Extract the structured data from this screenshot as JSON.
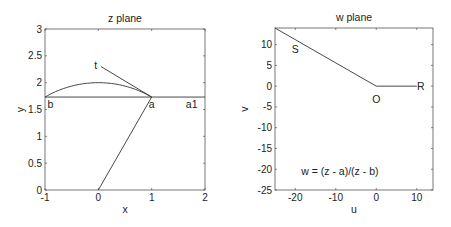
{
  "chart_data": [
    {
      "type": "line",
      "title": "z plane",
      "xlabel": "x",
      "ylabel": "y",
      "xlim": [
        -1,
        2
      ],
      "ylim": [
        0,
        3
      ],
      "xticks": [
        -1,
        0,
        1,
        2
      ],
      "xtick_labels": [
        "-1",
        "0",
        "1",
        "2"
      ],
      "yticks": [
        0,
        0.5,
        1,
        1.5,
        2,
        2.5,
        3
      ],
      "ytick_labels": [
        "0",
        "0.5",
        "1",
        "1.5",
        "2",
        "2.5",
        "3"
      ],
      "grid": false,
      "series": [
        {
          "name": "horizontal line y=sqrt(3)",
          "x": [
            -1,
            2
          ],
          "y": [
            1.732,
            1.732
          ]
        },
        {
          "name": "arc b-a",
          "x": [
            -1,
            -0.5,
            0,
            0.5,
            1
          ],
          "y": [
            1.732,
            1.936,
            2.0,
            1.936,
            1.732
          ]
        },
        {
          "name": "tangent t",
          "x": [
            0.05,
            1
          ],
          "y": [
            2.3,
            1.732
          ]
        },
        {
          "name": "ray from origin",
          "x": [
            0,
            1
          ],
          "y": [
            0,
            1.732
          ]
        }
      ],
      "annotations": [
        {
          "text": "t",
          "x": -0.05,
          "y": 2.33
        },
        {
          "text": "b",
          "x": -0.9,
          "y": 1.6
        },
        {
          "text": "a",
          "x": 1.0,
          "y": 1.6
        },
        {
          "text": "a1",
          "x": 1.75,
          "y": 1.6
        }
      ]
    },
    {
      "type": "line",
      "title": "w plane",
      "xlabel": "u",
      "ylabel": "v",
      "xlim": [
        -25,
        14
      ],
      "ylim": [
        -25,
        14
      ],
      "xticks": [
        -20,
        -10,
        0,
        10
      ],
      "xtick_labels": [
        "-20",
        "-10",
        "0",
        "10"
      ],
      "yticks": [
        -25,
        -20,
        -15,
        -10,
        -5,
        0,
        5,
        10
      ],
      "ytick_labels": [
        "-25",
        "-20",
        "-15",
        "-10",
        "-5",
        "0",
        "5",
        "10"
      ],
      "grid": false,
      "series": [
        {
          "name": "segment S",
          "x": [
            -25,
            0
          ],
          "y": [
            14,
            0
          ]
        },
        {
          "name": "segment R",
          "x": [
            0,
            10
          ],
          "y": [
            0,
            0
          ]
        }
      ],
      "annotations": [
        {
          "text": "S",
          "x": -20,
          "y": 9
        },
        {
          "text": "O",
          "x": 0,
          "y": -3
        },
        {
          "text": "R",
          "x": 11,
          "y": 0
        },
        {
          "text": "w = (z - a)/(z - b)",
          "x": -9,
          "y": -20.5
        }
      ]
    }
  ],
  "layout": {
    "line_color": "#333333",
    "axes_color": "#555555"
  }
}
